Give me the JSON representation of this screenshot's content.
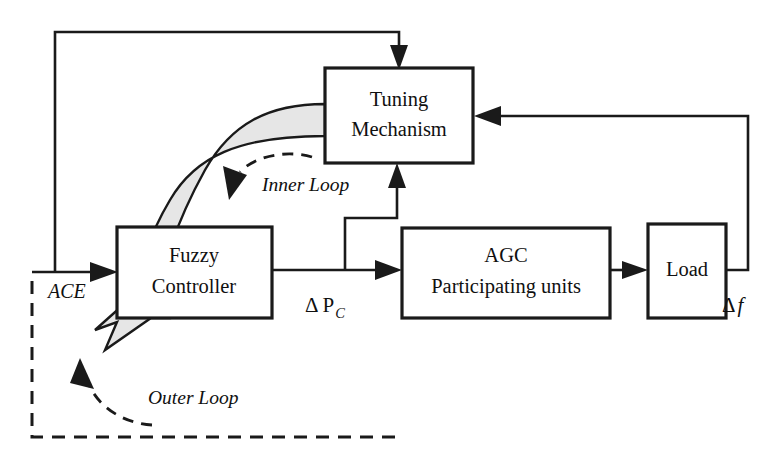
{
  "diagram": {
    "title": "AGC fuzzy control block diagram with inner and outer tuning loops",
    "blocks": [
      {
        "id": "tuning-mechanism",
        "lines": [
          "Tuning",
          "Mechanism"
        ],
        "x": 325,
        "y": 68,
        "w": 148,
        "h": 95
      },
      {
        "id": "fuzzy-controller",
        "lines": [
          "Fuzzy",
          "Controller"
        ],
        "x": 117,
        "y": 227,
        "w": 155,
        "h": 91
      },
      {
        "id": "agc-participating-units",
        "lines": [
          "AGC",
          "Participating units"
        ],
        "x": 402,
        "y": 228,
        "w": 208,
        "h": 90
      },
      {
        "id": "load",
        "lines": [
          "Load"
        ],
        "x": 648,
        "y": 224,
        "w": 78,
        "h": 94
      }
    ],
    "signal_labels": [
      {
        "id": "ace",
        "text": "ACE",
        "x": 48,
        "y": 298
      },
      {
        "id": "delta-pc",
        "base": "Δ P",
        "sub": "C",
        "x": 305,
        "y": 312
      },
      {
        "id": "delta-f",
        "base": "Δ",
        "italic": "f",
        "x": 722,
        "y": 312
      }
    ],
    "loop_labels": [
      {
        "id": "inner-loop",
        "text": "Inner Loop",
        "x": 262,
        "y": 191
      },
      {
        "id": "outer-loop",
        "text": "Outer Loop",
        "x": 148,
        "y": 404
      }
    ],
    "colors": {
      "stroke": "#1a1a1a",
      "block_fill": "#ffffff",
      "ribbon_fill": "#e6e6e6",
      "background": "#ffffff"
    }
  }
}
